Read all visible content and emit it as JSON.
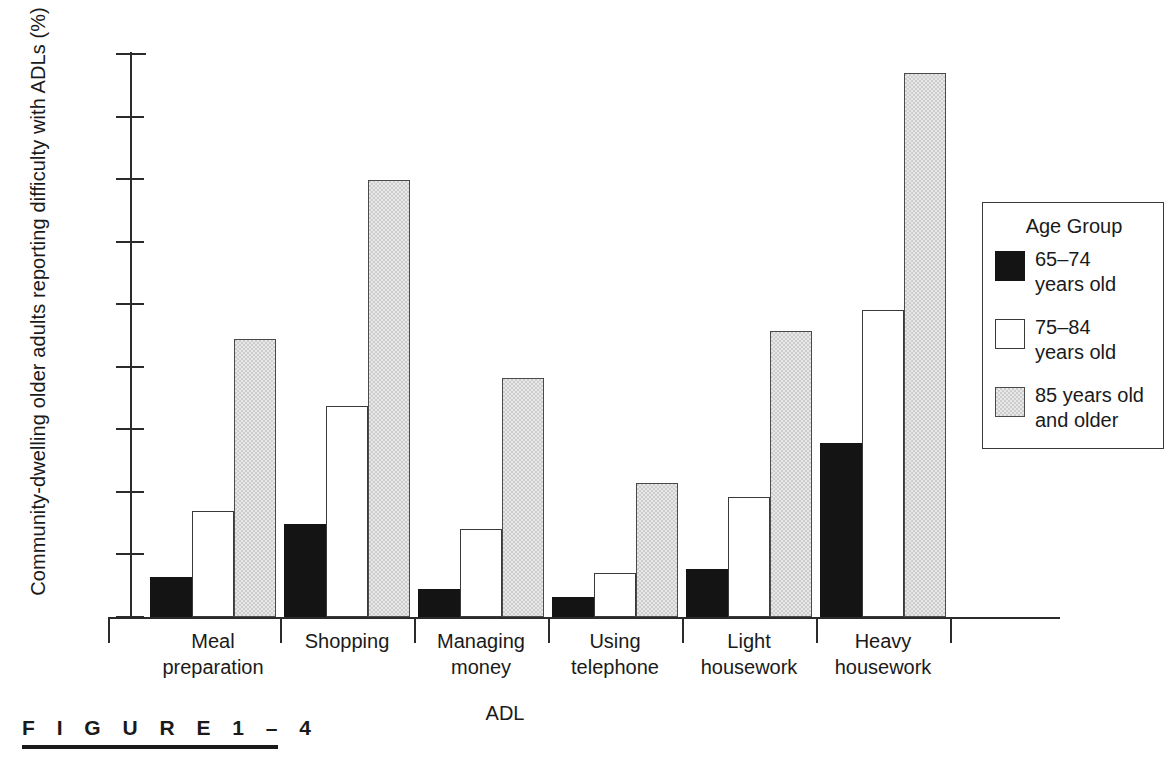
{
  "figure": {
    "caption_label": "F I G U R E   1 – 4"
  },
  "legend": {
    "title": "Age Group",
    "entries": [
      {
        "label": "65–74\nyears old",
        "line1": "65–74",
        "line2": "years old",
        "swatch": "black",
        "color": "#141414"
      },
      {
        "label": "75–84\nyears old",
        "line1": "75–84",
        "line2": "years old",
        "swatch": "white",
        "color": "#ffffff"
      },
      {
        "label": "85 years old\nand older",
        "line1": "85 years old",
        "line2": "and older",
        "swatch": "gray",
        "color": "#cdcdcd"
      }
    ]
  },
  "chart_data": {
    "type": "bar",
    "title": "",
    "xlabel": "ADL",
    "ylabel": "Community-dwelling older adults reporting difficulty with ADLs (%)",
    "ylim": [
      0,
      45
    ],
    "yticks": [
      0,
      5,
      10,
      15,
      20,
      25,
      30,
      35,
      40,
      45
    ],
    "ytick_labels": [
      "0",
      "5",
      "10",
      "15",
      "20",
      "25",
      "30",
      "35",
      "40",
      "45"
    ],
    "grid": false,
    "legend_position": "right",
    "categories": [
      "Meal preparation",
      "Shopping",
      "Managing money",
      "Using telephone",
      "Light housework",
      "Heavy housework"
    ],
    "category_lines": [
      [
        "Meal",
        "preparation"
      ],
      [
        "Shopping",
        ""
      ],
      [
        "Managing",
        "money"
      ],
      [
        "Using",
        "telephone"
      ],
      [
        "Light",
        "housework"
      ],
      [
        "Heavy",
        "housework"
      ]
    ],
    "series": [
      {
        "name": "65–74 years old",
        "color": "#141414",
        "values": [
          3.2,
          7.4,
          2.2,
          1.6,
          3.8,
          13.9
        ]
      },
      {
        "name": "75–84 years old",
        "color": "#ffffff",
        "values": [
          8.5,
          16.9,
          7.0,
          3.5,
          9.6,
          24.5
        ]
      },
      {
        "name": "85 years old and older",
        "color": "#cdcdcd",
        "values": [
          22.2,
          34.9,
          19.1,
          10.7,
          22.9,
          43.5
        ]
      }
    ]
  }
}
